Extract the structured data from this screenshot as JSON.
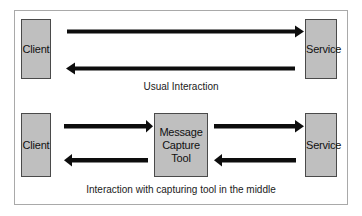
{
  "diagram": {
    "colors": {
      "box_fill": "#bfbfbf",
      "box_border": "#4a4a4a",
      "arrow": "#0d0d0d",
      "frame_border": "#a9a9a9",
      "background": "#ffffff",
      "text": "#111111"
    },
    "sections": [
      {
        "id": "usual",
        "caption": "Usual Interaction",
        "nodes": [
          {
            "id": "client-top",
            "label": "Client"
          },
          {
            "id": "service-top",
            "label": "Service"
          }
        ],
        "arrows": [
          {
            "id": "client-to-service",
            "direction": "right",
            "from": "Client",
            "to": "Service"
          },
          {
            "id": "service-to-client",
            "direction": "left",
            "from": "Service",
            "to": "Client"
          }
        ]
      },
      {
        "id": "capturing",
        "caption": "Interaction with capturing tool in the middle",
        "nodes": [
          {
            "id": "client-bottom",
            "label": "Client"
          },
          {
            "id": "tool-middle",
            "label": "Message\nCapture\nTool"
          },
          {
            "id": "service-bottom",
            "label": "Service"
          }
        ],
        "arrows": [
          {
            "id": "client-to-tool",
            "direction": "right",
            "from": "Client",
            "to": "Message Capture Tool"
          },
          {
            "id": "tool-to-service",
            "direction": "right",
            "from": "Message Capture Tool",
            "to": "Service"
          },
          {
            "id": "tool-to-client",
            "direction": "left",
            "from": "Message Capture Tool",
            "to": "Client"
          },
          {
            "id": "service-to-tool",
            "direction": "left",
            "from": "Service",
            "to": "Message Capture Tool"
          }
        ]
      }
    ]
  }
}
